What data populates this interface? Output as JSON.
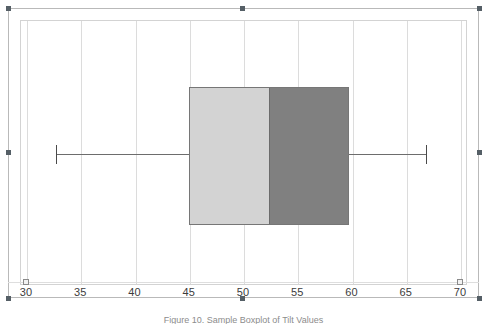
{
  "figure": {
    "caption": "Figure 10. Sample Boxplot of Tilt Values",
    "background_color": "#ffffff",
    "frame_color": "#b9b9b9",
    "plot_border_color": "#d3d3d3",
    "gridline_color": "#dcdcdc"
  },
  "chart_data": {
    "type": "box",
    "orientation": "horizontal",
    "title": "",
    "xlabel": "",
    "ylabel": "",
    "xlim": [
      30,
      70
    ],
    "xticks": [
      30,
      35,
      40,
      45,
      50,
      55,
      60,
      65,
      70
    ],
    "xticklabels": [
      "30",
      "35",
      "40",
      "45",
      "50",
      "55",
      "60",
      "65",
      "70"
    ],
    "grid": true,
    "grid_axis": "x",
    "legend": false,
    "series": [
      {
        "name": "Sample",
        "min": 32.7,
        "q1": 44.9,
        "median": 52.2,
        "q3": 59.7,
        "max": 66.8,
        "outliers": [],
        "lower_half_color": "#d3d3d3",
        "upper_half_color": "#808080",
        "box_edge_color": "#767676",
        "whisker_color": "#6d6d6d"
      }
    ]
  },
  "axis": {
    "ticks": [
      {
        "value": 30,
        "label": "30"
      },
      {
        "value": 35,
        "label": "35"
      },
      {
        "value": 40,
        "label": "40"
      },
      {
        "value": 45,
        "label": "45"
      },
      {
        "value": 50,
        "label": "50"
      },
      {
        "value": 55,
        "label": "55"
      },
      {
        "value": 60,
        "label": "60"
      },
      {
        "value": 65,
        "label": "65"
      },
      {
        "value": 70,
        "label": "70"
      }
    ],
    "endpoints": [
      30,
      70
    ]
  },
  "selection": {
    "handle_color": "#555f66",
    "handle_count": 8
  }
}
